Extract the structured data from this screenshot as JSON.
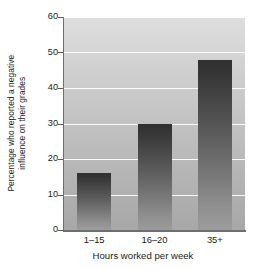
{
  "chart_data": {
    "type": "bar",
    "title": "",
    "subtitle": "",
    "xlabel": "Hours worked per week",
    "ylabel": "Percentage who reported a negative influence on their grades",
    "ylabel_lines": [
      "Percentage who reported a negative",
      "influence on their grades"
    ],
    "categories": [
      "1–15",
      "16–20",
      "35+"
    ],
    "values": [
      16,
      30,
      48
    ],
    "ylim": [
      0,
      60
    ],
    "yticks": [
      0,
      10,
      20,
      30,
      40,
      50,
      60
    ],
    "ytick_labels": [
      "0",
      "10",
      "20",
      "30",
      "40",
      "50",
      "60"
    ],
    "grid": true,
    "grid_axis": "y",
    "grid_color": "#fbfbfb",
    "legend": false,
    "legend_position": "none",
    "bar_count": 3,
    "bar_gradient_top_color": "#2f2f2f",
    "bar_gradient_bottom_color": "#9c9c9c",
    "plot_background_top_color": "#dedede",
    "plot_background_bottom_color": "#a8a8a8",
    "figure_background_color": "#ffffff",
    "axis_color": "#6e6e6e",
    "text_color": "#1a1a1a"
  }
}
